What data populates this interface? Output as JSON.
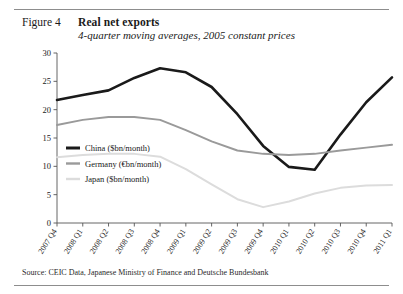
{
  "figure": {
    "number": "Figure 4",
    "title": "Real net exports",
    "subtitle": "4-quarter moving averages, 2005 constant prices",
    "source": "Source: CEIC Data, Japanese Ministry of Finance and Deutsche Bundesbank"
  },
  "colors": {
    "china": "#1a1a1a",
    "germany": "#9a9a9a",
    "japan": "#dcdcdc",
    "axis": "#555555",
    "rule": "#8d8d8d"
  },
  "chart_data": {
    "type": "line",
    "title": "Real net exports",
    "subtitle": "4-quarter moving averages, 2005 constant prices",
    "xlabel": "",
    "ylabel": "",
    "ylim": [
      0,
      30
    ],
    "yticks": [
      0,
      5,
      10,
      15,
      20,
      25,
      30
    ],
    "grid": false,
    "legend_position": "inside-lower-left",
    "categories": [
      "2007 Q4",
      "2008 Q1",
      "2008 Q2",
      "2008 Q3",
      "2008 Q4",
      "2009 Q1",
      "2009 Q2",
      "2009 Q3",
      "2009 Q4",
      "2010 Q1",
      "2010 Q2",
      "2010 Q3",
      "2010 Q4",
      "2011 Q1"
    ],
    "series": [
      {
        "name": "China ($bn/month)",
        "color": "#1a1a1a",
        "values": [
          21.7,
          22.6,
          23.4,
          25.6,
          27.3,
          26.6,
          24.0,
          19.2,
          13.6,
          9.9,
          9.4,
          15.6,
          21.3,
          25.7
        ]
      },
      {
        "name": "Germany (€bn/month)",
        "color": "#9a9a9a",
        "values": [
          17.3,
          18.2,
          18.7,
          18.7,
          18.2,
          16.4,
          14.4,
          12.8,
          12.2,
          12.0,
          12.2,
          12.8,
          13.3,
          13.8
        ]
      },
      {
        "name": "Japan ($bn/month)",
        "color": "#dcdcdc",
        "values": [
          11.6,
          12.0,
          12.2,
          12.2,
          11.7,
          9.5,
          6.8,
          4.2,
          2.8,
          3.8,
          5.2,
          6.2,
          6.6,
          6.7
        ]
      }
    ]
  },
  "legend": {
    "items": [
      {
        "label": "China ($bn/month)"
      },
      {
        "label": "Germany (€bn/month)"
      },
      {
        "label": "Japan ($bn/month)"
      }
    ]
  }
}
